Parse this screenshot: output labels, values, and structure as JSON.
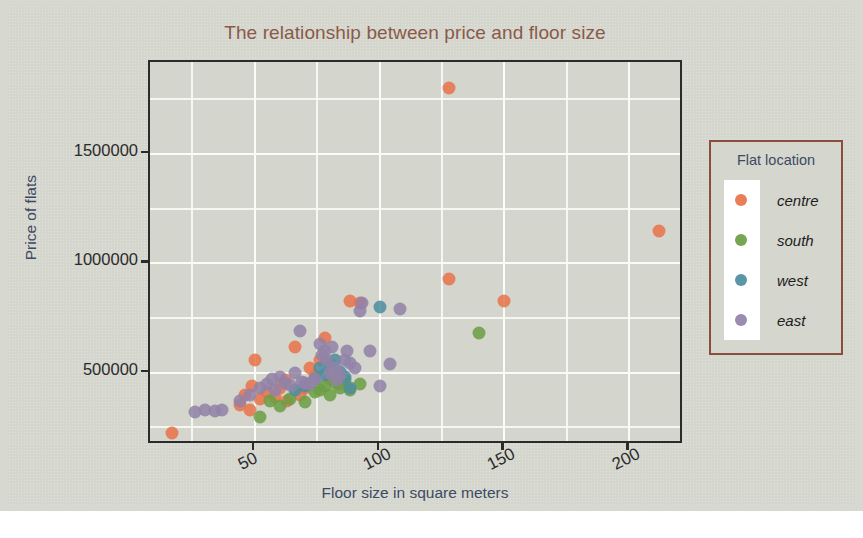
{
  "colors": {
    "page_background": "#ffffff",
    "panel_background": "#d5d6ce",
    "plot_background": "#d4d5cd",
    "grid": "#fbfbf8",
    "axis": "#2b2b2b",
    "title": "#8a5a49",
    "axis_label": "#3c4a63",
    "legend_border": "#8a4f3c",
    "legend_strip": "#ffffff",
    "centre": "#e8734a",
    "south": "#6a9e43",
    "west": "#4d8d9e",
    "east": "#9182a8"
  },
  "legend": {
    "title": "Flat location",
    "entries": [
      {
        "label": "centre",
        "color": "#e8734a"
      },
      {
        "label": "south",
        "color": "#6a9e43"
      },
      {
        "label": "west",
        "color": "#4d8d9e"
      },
      {
        "label": "east",
        "color": "#9182a8"
      }
    ]
  },
  "chart_data": {
    "type": "scatter",
    "title": "The relationship between price and floor size",
    "xlabel": "Floor size in square meters",
    "ylabel": "Price of flats",
    "xlim": [
      8,
      222
    ],
    "ylim": [
      170000,
      1920000
    ],
    "xticks": [
      50,
      100,
      150,
      200
    ],
    "xtick_labels": [
      "50",
      "100",
      "150",
      "200"
    ],
    "yticks": [
      500000,
      1000000,
      1500000
    ],
    "ytick_labels": [
      "500000",
      "1000000",
      "1500000"
    ],
    "grid": true,
    "grid_minor": true,
    "legend_position": "right-outside",
    "legend_title": "Flat location",
    "marker_size": 13,
    "series": [
      {
        "name": "centre",
        "color": "#e8734a",
        "points": [
          [
            17,
            225000
          ],
          [
            44,
            355000
          ],
          [
            46,
            400000
          ],
          [
            48,
            330000
          ],
          [
            49,
            440000
          ],
          [
            50,
            560000
          ],
          [
            52,
            380000
          ],
          [
            55,
            410000
          ],
          [
            58,
            390000
          ],
          [
            60,
            430000
          ],
          [
            62,
            465000
          ],
          [
            63,
            370000
          ],
          [
            66,
            620000
          ],
          [
            68,
            400000
          ],
          [
            70,
            430000
          ],
          [
            72,
            520000
          ],
          [
            74,
            485000
          ],
          [
            76,
            560000
          ],
          [
            78,
            660000
          ],
          [
            80,
            470000
          ],
          [
            84,
            450000
          ],
          [
            88,
            830000
          ],
          [
            92,
            820000
          ],
          [
            128,
            1800000
          ],
          [
            128,
            930000
          ],
          [
            150,
            830000
          ],
          [
            212,
            1150000
          ]
        ]
      },
      {
        "name": "south",
        "color": "#6a9e43",
        "points": [
          [
            52,
            300000
          ],
          [
            56,
            370000
          ],
          [
            60,
            350000
          ],
          [
            64,
            380000
          ],
          [
            70,
            365000
          ],
          [
            74,
            410000
          ],
          [
            76,
            420000
          ],
          [
            78,
            440000
          ],
          [
            80,
            400000
          ],
          [
            82,
            455000
          ],
          [
            84,
            430000
          ],
          [
            86,
            465000
          ],
          [
            88,
            420000
          ],
          [
            92,
            450000
          ],
          [
            140,
            680000
          ]
        ]
      },
      {
        "name": "west",
        "color": "#4d8d9e",
        "points": [
          [
            66,
            420000
          ],
          [
            70,
            440000
          ],
          [
            74,
            470000
          ],
          [
            76,
            520000
          ],
          [
            78,
            490000
          ],
          [
            80,
            540000
          ],
          [
            82,
            560000
          ],
          [
            84,
            505000
          ],
          [
            86,
            480000
          ],
          [
            88,
            430000
          ],
          [
            100,
            800000
          ]
        ]
      },
      {
        "name": "east",
        "color": "#9182a8",
        "points": [
          [
            26,
            320000
          ],
          [
            30,
            330000
          ],
          [
            34,
            325000
          ],
          [
            37,
            330000
          ],
          [
            44,
            370000
          ],
          [
            48,
            400000
          ],
          [
            52,
            430000
          ],
          [
            55,
            450000
          ],
          [
            57,
            470000
          ],
          [
            58,
            420000
          ],
          [
            60,
            480000
          ],
          [
            62,
            455000
          ],
          [
            64,
            445000
          ],
          [
            66,
            500000
          ],
          [
            68,
            690000
          ],
          [
            69,
            460000
          ],
          [
            70,
            455000
          ],
          [
            72,
            450000
          ],
          [
            74,
            470000
          ],
          [
            76,
            630000
          ],
          [
            77,
            580000
          ],
          [
            78,
            600000
          ],
          [
            79,
            560000
          ],
          [
            80,
            500000
          ],
          [
            81,
            620000
          ],
          [
            82,
            520000
          ],
          [
            83,
            465000
          ],
          [
            84,
            490000
          ],
          [
            86,
            560000
          ],
          [
            87,
            600000
          ],
          [
            88,
            545000
          ],
          [
            90,
            520000
          ],
          [
            92,
            780000
          ],
          [
            93,
            820000
          ],
          [
            96,
            600000
          ],
          [
            100,
            440000
          ],
          [
            104,
            540000
          ],
          [
            108,
            790000
          ]
        ]
      }
    ]
  }
}
